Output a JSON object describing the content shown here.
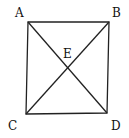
{
  "diagram": {
    "type": "geometry",
    "shape": "square with diagonals",
    "points": {
      "A": {
        "label": "A",
        "x": 28,
        "y": 22
      },
      "B": {
        "label": "B",
        "x": 109,
        "y": 22
      },
      "C": {
        "label": "C",
        "x": 26,
        "y": 114
      },
      "D": {
        "label": "D",
        "x": 107,
        "y": 113
      },
      "E": {
        "label": "E",
        "x": 68,
        "y": 68
      }
    },
    "segments": [
      "AB",
      "BD",
      "DC",
      "CA",
      "AD",
      "BC"
    ],
    "colors": {
      "stroke": "#222222",
      "background": "#ffffff"
    }
  }
}
